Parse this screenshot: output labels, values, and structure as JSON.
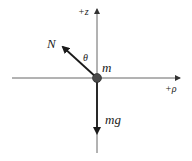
{
  "diagram": {
    "type": "free-body-diagram",
    "axes": {
      "vertical_label": "+z",
      "horizontal_label": "+ρ"
    },
    "body": {
      "label": "m"
    },
    "forces": [
      {
        "name": "normal",
        "label": "N",
        "direction": "up-left"
      },
      {
        "name": "gravity",
        "label": "mg",
        "direction": "down"
      }
    ],
    "angle": {
      "label": "θ",
      "between": "N and +z axis"
    },
    "colors": {
      "axis": "#555555",
      "arrow": "#1a1a1a",
      "mass": "#444444",
      "text": "#222222"
    }
  }
}
